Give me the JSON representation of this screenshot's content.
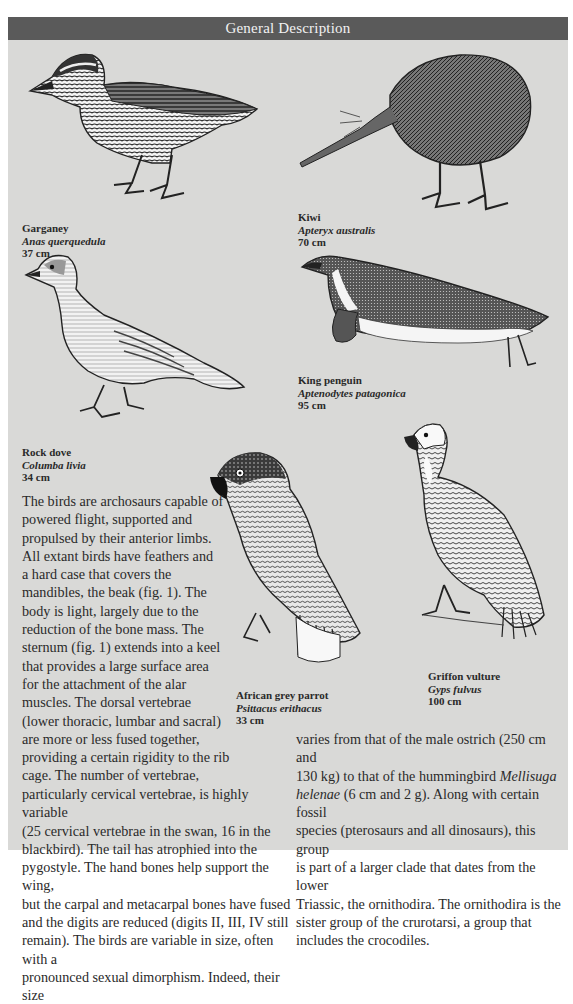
{
  "header": {
    "title": "General Description"
  },
  "colors": {
    "header_bg": "#5a5a5a",
    "header_text": "#f2f2f2",
    "panel_bg": "#d9d9d7",
    "text": "#2a2a2a"
  },
  "birds": [
    {
      "id": "garganey",
      "common": "Garganey",
      "latin": "Anas querquedula",
      "size": "37 cm"
    },
    {
      "id": "kiwi",
      "common": "Kiwi",
      "latin": "Apteryx australis",
      "size": "70 cm"
    },
    {
      "id": "king-penguin",
      "common": "King penguin",
      "latin": "Aptenodytes patagonica",
      "size": "95 cm"
    },
    {
      "id": "rock-dove",
      "common": "Rock dove",
      "latin": "Columba livia",
      "size": "34 cm"
    },
    {
      "id": "african-grey-parrot",
      "common": "African grey parrot",
      "latin": "Psittacus erithacus",
      "size": "33 cm"
    },
    {
      "id": "griffon-vulture",
      "common": "Griffon vulture",
      "latin": "Gyps fulvus",
      "size": "100 cm"
    }
  ],
  "body": {
    "narrow_lines": [
      "The birds are archosaurs capable of",
      "powered flight, supported and",
      "propulsed by their anterior limbs.",
      "All extant birds have feathers and",
      "a hard case that covers the",
      "mandibles, the beak (fig. 1). The",
      "body is light, largely due to the",
      "reduction of the bone mass. The",
      "sternum (fig. 1) extends into a keel",
      "that provides a large surface area",
      "for the attachment of the alar",
      "muscles. The dorsal vertebrae",
      "(lower thoracic, lumbar and sacral)",
      "are more or less fused together,",
      "providing a certain rigidity to the rib",
      "cage. The number of vertebrae,"
    ],
    "left_lines": [
      "particularly cervical vertebrae, is highly variable",
      "(25 cervical vertebrae in the swan, 16 in the",
      "blackbird). The tail has atrophied into the",
      "pygostyle. The hand bones help support the wing,",
      "but the carpal and metacarpal bones have fused",
      "and the digits are reduced (digits II, III, IV still",
      "remain). The birds are variable in size, often with a",
      "pronounced sexual dimorphism. Indeed, their size"
    ],
    "right_line_1": "varies from that of the male ostrich (250 cm and",
    "right_line_2_pre": "130 kg) to that of the hummingbird ",
    "right_line_2_italic": "Mellisuga",
    "right_line_3_italic": "helenae",
    "right_line_3_post": " (6 cm and 2 g). Along with certain fossil",
    "right_lines_rest": [
      "species (pterosaurs and all dinosaurs), this group",
      "is part of a larger clade that dates from the lower",
      "Triassic, the ornithodira. The ornithodira is the",
      "sister group of the crurotarsi, a group that",
      "includes the crocodiles."
    ]
  }
}
